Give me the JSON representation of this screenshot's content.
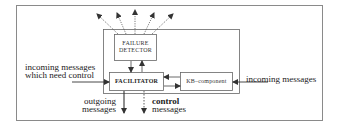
{
  "diagram": {
    "components": {
      "failure_detector": {
        "line1": "FAILURE",
        "line2": "DETECTOR"
      },
      "facilitator": {
        "label": "FACILITATOR"
      },
      "kb_component": {
        "label": "KB–component"
      }
    },
    "labels": {
      "incoming_control_line1": "incoming messages",
      "incoming_control_line2": "which need control",
      "incoming_right": "incoming messages",
      "outgoing_line1": "outgoing",
      "outgoing_line2": "messages",
      "control_line1": "control",
      "control_line2": "messages"
    },
    "colors": {
      "line": "#444444",
      "frame": "#888888",
      "background": "#ffffff"
    }
  }
}
